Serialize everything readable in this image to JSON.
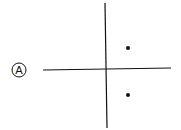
{
  "diagram": {
    "option_label": "A",
    "axes": {
      "x_axis": "horizontal",
      "y_axis": "vertical"
    },
    "points": [
      {
        "quadrant": "I",
        "x": 1,
        "y": 1
      },
      {
        "quadrant": "IV",
        "x": 1,
        "y": -1
      }
    ],
    "colors": {
      "ink": "#111111",
      "background": "#ffffff"
    }
  }
}
